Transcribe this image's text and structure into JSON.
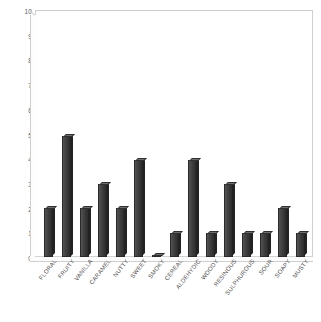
{
  "chart_data": {
    "type": "bar",
    "title": "",
    "subtitle": "",
    "xlabel": "",
    "ylabel": "",
    "ylim": [
      0,
      10
    ],
    "grid": false,
    "legend": false,
    "legend_position": "none",
    "y_ticks": [
      10,
      9,
      8,
      7,
      6,
      5,
      4,
      3,
      2,
      1,
      0
    ],
    "categories": [
      "FLORAL",
      "FRUITY",
      "VANILLA",
      "CARAMEL",
      "NUTTY",
      "SWEET",
      "SMOKY",
      "CEREAL",
      "ALDEHYDIC",
      "WOODY",
      "RESINOUS",
      "SULPHUROUS",
      "SOUR",
      "SOAPY",
      "MUSTY"
    ],
    "values": [
      2,
      5,
      2,
      3,
      2,
      4,
      0.1,
      1,
      4,
      1,
      3,
      1,
      1,
      2,
      1
    ],
    "bar_color": "#3f3f3f",
    "bar_top_color": "#6e6e6e",
    "axis_color": "#cfcfcf",
    "tick_label_color": "#5a5a5a",
    "background_color": "#ffffff"
  }
}
